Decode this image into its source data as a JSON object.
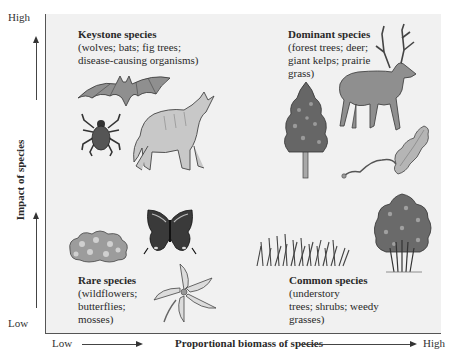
{
  "axes": {
    "y": {
      "label": "Impact of species",
      "high": "High",
      "low": "Low"
    },
    "x": {
      "label": "Proportional biomass of species",
      "high": "High",
      "low": "Low"
    }
  },
  "quadrants": {
    "keystone": {
      "title": "Keystone species",
      "lines": [
        "(wolves; bats; fig trees;",
        "disease-causing organisms)"
      ],
      "illustrations": [
        "bat",
        "tick",
        "wolf"
      ]
    },
    "dominant": {
      "title": "Dominant species",
      "lines": [
        "(forest trees; deer;",
        "giant kelps; prairie",
        "grass)"
      ],
      "illustrations": [
        "tree",
        "deer",
        "kelp"
      ]
    },
    "rare": {
      "title": "Rare species",
      "lines": [
        "(wildflowers;",
        "butterflies;",
        "mosses)"
      ],
      "illustrations": [
        "moss",
        "butterfly",
        "wildflower"
      ]
    },
    "common": {
      "title": "Common species",
      "lines": [
        "(understory",
        "trees; shrubs; weedy",
        "grasses)"
      ],
      "illustrations": [
        "grass",
        "shrub"
      ]
    }
  },
  "colors": {
    "plot_bg": "#f1f1f1",
    "axis": "#555555",
    "illustration_fill": "#9a9a9a",
    "illustration_dark": "#4a4a4a",
    "illustration_light": "#cfcfcf"
  }
}
